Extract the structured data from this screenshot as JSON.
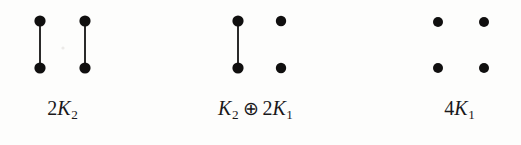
{
  "figure": {
    "background_color": "#fdfdfc",
    "vertex_color": "#100f0f",
    "edge_color": "#2b2a2a",
    "width": 521,
    "height": 145,
    "panels": [
      {
        "id": "graph-2K2",
        "label_plain": "2K2",
        "label_parts": {
          "coefficient": "2",
          "symbol": "K",
          "subscript": "2"
        },
        "vertices": [
          {
            "name": "v1",
            "cx": 40,
            "cy": 21,
            "r": 5.6
          },
          {
            "name": "v2",
            "cx": 40,
            "cy": 68,
            "r": 5.6
          },
          {
            "name": "v3",
            "cx": 85,
            "cy": 21,
            "r": 5.6
          },
          {
            "name": "v4",
            "cx": 85,
            "cy": 68,
            "r": 5.6
          }
        ],
        "edges": [
          {
            "from": "v1",
            "to": "v2",
            "x1": 40,
            "y1": 21,
            "x2": 40,
            "y2": 68
          },
          {
            "from": "v3",
            "to": "v4",
            "x1": 85,
            "y1": 21,
            "x2": 85,
            "y2": 68
          }
        ],
        "artifacts": [
          {
            "cx": 63,
            "cy": 48,
            "r": 1.6
          }
        ]
      },
      {
        "id": "graph-K2-plus-2K1",
        "label_plain": "K2 ⊕ 2K1",
        "label_parts": {
          "left_symbol": "K",
          "left_subscript": "2",
          "operator": "⊕",
          "right_coefficient": "2",
          "right_symbol": "K",
          "right_subscript": "1"
        },
        "vertices": [
          {
            "name": "v1",
            "cx": 63,
            "cy": 21,
            "r": 5.6
          },
          {
            "name": "v2",
            "cx": 63,
            "cy": 68,
            "r": 5.6
          },
          {
            "name": "v3",
            "cx": 106,
            "cy": 21,
            "r": 5.2
          },
          {
            "name": "v4",
            "cx": 106,
            "cy": 68,
            "r": 5.2
          }
        ],
        "edges": [
          {
            "from": "v1",
            "to": "v2",
            "x1": 63,
            "y1": 21,
            "x2": 63,
            "y2": 68
          }
        ],
        "artifacts": []
      },
      {
        "id": "graph-4K1",
        "label_plain": "4K1",
        "label_parts": {
          "coefficient": "4",
          "symbol": "K",
          "subscript": "1"
        },
        "vertices": [
          {
            "name": "v1",
            "cx": 98,
            "cy": 22,
            "r": 5.0
          },
          {
            "name": "v2",
            "cx": 98,
            "cy": 68,
            "r": 5.0
          },
          {
            "name": "v3",
            "cx": 144,
            "cy": 22,
            "r": 5.0
          },
          {
            "name": "v4",
            "cx": 144,
            "cy": 68,
            "r": 5.0
          }
        ],
        "edges": [],
        "artifacts": []
      }
    ]
  }
}
